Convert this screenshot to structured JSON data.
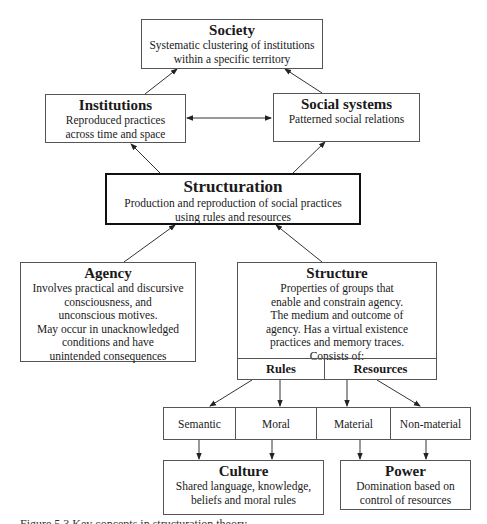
{
  "diagram": {
    "society": {
      "title": "Society",
      "description": "Systematic clustering of institutions\nwithin a specific territory"
    },
    "institutions": {
      "title": "Institutions",
      "description": "Reproduced practices\nacross time and space"
    },
    "social_systems": {
      "title": "Social systems",
      "description": "Patterned social relations"
    },
    "structuration": {
      "title": "Structuration",
      "description": "Production and reproduction of social practices\nusing rules and resources"
    },
    "agency": {
      "title": "Agency",
      "description": "Involves practical and discursive\nconsciousness, and\nunconscious motives.\nMay occur in unacknowledged\nconditions and have\nunintended consequences"
    },
    "structure": {
      "title": "Structure",
      "description": "Properties of groups that\nenable and constrain agency.\nThe medium and outcome of\nagency. Has a virtual existence\npractices and memory traces.\nConsists of:",
      "parts": [
        "Rules",
        "Resources"
      ]
    },
    "types": [
      "Semantic",
      "Moral",
      "Material",
      "Non-material"
    ],
    "culture": {
      "title": "Culture",
      "description": "Shared language, knowledge,\nbeliefs and moral rules"
    },
    "power": {
      "title": "Power",
      "description": "Domination based on\ncontrol of resources"
    },
    "edges": [
      {
        "from": "Institutions",
        "to": "Society"
      },
      {
        "from": "Social systems",
        "to": "Society"
      },
      {
        "from": "Institutions",
        "to": "Social systems",
        "bidirectional": true
      },
      {
        "from": "Structuration",
        "to": "Institutions"
      },
      {
        "from": "Structuration",
        "to": "Social systems"
      },
      {
        "from": "Agency",
        "to": "Structuration"
      },
      {
        "from": "Structure",
        "to": "Structuration"
      },
      {
        "from": "Rules",
        "to": "Semantic"
      },
      {
        "from": "Rules",
        "to": "Moral"
      },
      {
        "from": "Resources",
        "to": "Material"
      },
      {
        "from": "Resources",
        "to": "Non-material"
      },
      {
        "from": "Semantic",
        "to": "Culture"
      },
      {
        "from": "Moral",
        "to": "Culture"
      },
      {
        "from": "Material",
        "to": "Power"
      },
      {
        "from": "Non-material",
        "to": "Power"
      }
    ]
  },
  "caption": "Figure 5.3  Key concepts in structuration theory"
}
